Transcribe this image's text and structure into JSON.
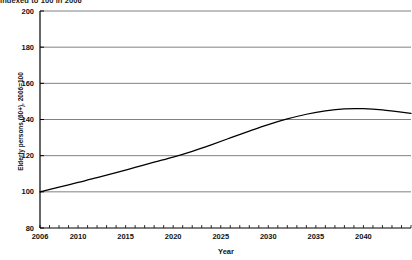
{
  "chart_data": {
    "type": "line",
    "title": "indexed to 100 in 2006",
    "xlabel": "Year",
    "ylabel": "Elderly persons (60+), 2006=100",
    "xlim": [
      2006,
      2045
    ],
    "ylim": [
      80,
      200
    ],
    "grid": true,
    "legend": "none",
    "y_ticks": [
      200,
      180,
      160,
      140,
      120,
      100,
      80
    ],
    "x_ticks": [
      2006,
      2010,
      2015,
      2020,
      2025,
      2030,
      2035,
      2040
    ],
    "x_minor_tick_step": 1,
    "series": [
      {
        "name": "Elderly persons (60+) index",
        "color": "#000000",
        "x": [
          2006,
          2008,
          2010,
          2012,
          2014,
          2016,
          2018,
          2020,
          2022,
          2024,
          2026,
          2028,
          2030,
          2032,
          2034,
          2036,
          2038,
          2040,
          2042,
          2045
        ],
        "values": [
          100.0,
          102.6,
          105.2,
          107.8,
          110.6,
          113.5,
          116.4,
          119.2,
          122.4,
          126.0,
          129.8,
          133.6,
          137.2,
          140.3,
          142.9,
          144.8,
          145.9,
          146.0,
          145.3,
          143.4
        ]
      }
    ]
  },
  "axis": {
    "y_tick_labels": [
      "200",
      "180",
      "160",
      "140",
      "120",
      "100",
      "80"
    ],
    "x_tick_labels": [
      "2006",
      "2010",
      "2015",
      "2020",
      "2025",
      "2030",
      "2035",
      "2040"
    ]
  },
  "colors": {
    "line": "#000000",
    "grid": "#808080",
    "axis": "#000000",
    "background": "#ffffff"
  }
}
